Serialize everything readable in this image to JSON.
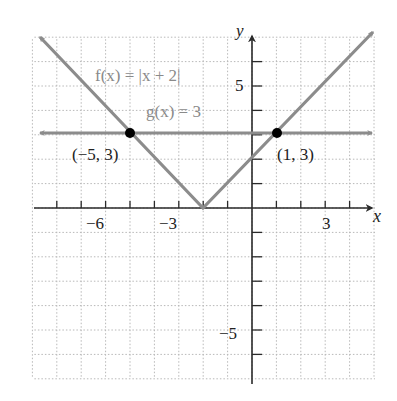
{
  "chart_data": {
    "type": "line",
    "title": "",
    "xlabel": "x",
    "ylabel": "y",
    "xlim": [
      -9,
      5
    ],
    "ylim": [
      -7,
      7
    ],
    "grid": true,
    "x_tick_labels": [
      {
        "value": -6,
        "label": "−6"
      },
      {
        "value": -3,
        "label": "−3"
      },
      {
        "value": 3,
        "label": "3"
      }
    ],
    "y_tick_labels": [
      {
        "value": 5,
        "label": "5"
      },
      {
        "value": -5,
        "label": "−5"
      }
    ],
    "series": [
      {
        "name": "f(x) = |x + 2|",
        "label": "f(x) = |x + 2|",
        "type": "absolute-value",
        "points": [
          [
            -9,
            7
          ],
          [
            -2,
            0
          ],
          [
            5,
            7
          ]
        ],
        "color": "#8c8c8c"
      },
      {
        "name": "g(x) = 3",
        "label": "g(x) = 3",
        "type": "horizontal-line",
        "points": [
          [
            -9,
            3
          ],
          [
            5,
            3
          ]
        ],
        "color": "#8c8c8c"
      }
    ],
    "annotations": [
      {
        "point": [
          -5,
          3
        ],
        "label": "(−5, 3)"
      },
      {
        "point": [
          1,
          3
        ],
        "label": "(1, 3)"
      }
    ]
  },
  "labels": {
    "x_axis": "x",
    "y_axis": "y",
    "f_label": "f(x) = |x + 2|",
    "g_label": "g(x) = 3",
    "point_left": "(−5, 3)",
    "point_right": "(1, 3)",
    "tick_x_neg6": "−6",
    "tick_x_neg3": "−3",
    "tick_x_3": "3",
    "tick_y_5": "5",
    "tick_y_neg5": "−5"
  },
  "colors": {
    "grid": "#b8b8b8",
    "axis": "#2a2a2a",
    "curve": "#8c8c8c",
    "point": "#000000",
    "label_gray": "#8a8a8a",
    "text": "#222222"
  }
}
